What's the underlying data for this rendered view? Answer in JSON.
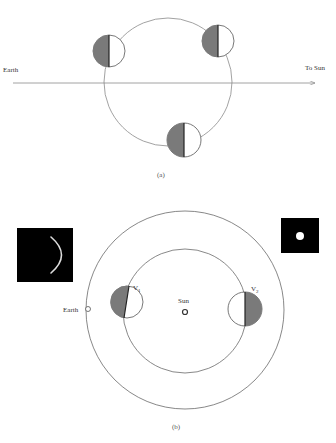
{
  "colors": {
    "line": "#8a8a8a",
    "shade": "#7a7a7a",
    "dark_edge": "#222222",
    "panel_bg": "#000000",
    "panel_light": "#ffffff"
  },
  "diagram_a": {
    "label_earth": "Earth",
    "label_sun": "To Sun",
    "caption": "(a)",
    "orbit": {
      "cx": 168,
      "cy": 82,
      "r": 64
    },
    "axis": {
      "x1": 13,
      "x2": 315,
      "y": 83
    },
    "moons": [
      {
        "cx": 109,
        "cy": 51,
        "r": 16
      },
      {
        "cx": 218,
        "cy": 41,
        "r": 16
      },
      {
        "cx": 184,
        "cy": 140,
        "r": 17
      }
    ]
  },
  "diagram_b": {
    "label_earth": "Earth",
    "label_sun": "Sun",
    "label_v1": "V",
    "label_v1_sub": "1",
    "label_v2": "V",
    "label_v2_sub": "2",
    "caption": "(b)",
    "outer_orbit": {
      "cx": 185,
      "cy": 310,
      "r": 99
    },
    "inner_orbit": {
      "cx": 185,
      "cy": 311,
      "r": 62
    },
    "sun": {
      "cx": 185,
      "cy": 312,
      "r": 2.5
    },
    "earth": {
      "cx": 88,
      "cy": 309,
      "r": 2.5
    },
    "v1": {
      "cx": 127,
      "cy": 302,
      "r": 16
    },
    "v2": {
      "cx": 245,
      "cy": 309,
      "r": 17
    },
    "crescent_panel": {
      "x": 17,
      "y": 228,
      "w": 56,
      "h": 54
    },
    "full_panel": {
      "x": 281,
      "y": 218,
      "w": 38,
      "h": 35,
      "dot_r": 4
    }
  }
}
